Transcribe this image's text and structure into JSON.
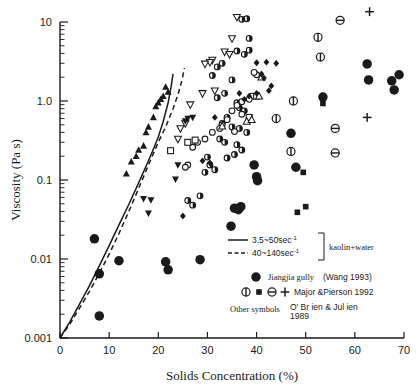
{
  "chart_data": {
    "type": "scatter",
    "title": "",
    "xlabel": "Solids Concentration (%)",
    "ylabel": "Viscosity  (Pa s)",
    "xlim": [
      0,
      70
    ],
    "ylim": [
      0.001,
      10
    ],
    "yscale": "log",
    "xscale": "linear",
    "grid": false,
    "xticks": [
      "0",
      "10",
      "20",
      "30",
      "40",
      "50",
      "60",
      "70"
    ],
    "xtick_values": [
      0,
      10,
      20,
      30,
      40,
      50,
      60,
      70
    ],
    "yticks": [
      "0.001",
      "0.01",
      "0.1",
      "1.0",
      "10"
    ],
    "ytick_values": [
      0.001,
      0.01,
      0.1,
      1.0,
      10
    ],
    "legend_position": "lower-right",
    "curves": [
      {
        "name": "3.5~50sec-1",
        "style": "solid",
        "label": "3.5~50sec",
        "exponent": "-1",
        "points": [
          [
            0,
            0.001
          ],
          [
            2,
            0.0016
          ],
          [
            4,
            0.0027
          ],
          [
            6,
            0.0046
          ],
          [
            8,
            0.0082
          ],
          [
            10,
            0.0148
          ],
          [
            12,
            0.027
          ],
          [
            14,
            0.049
          ],
          [
            16,
            0.092
          ],
          [
            18,
            0.175
          ],
          [
            19,
            0.245
          ],
          [
            20,
            0.35
          ],
          [
            21,
            0.55
          ],
          [
            22,
            0.95
          ],
          [
            22.6,
            1.5
          ],
          [
            23,
            2.2
          ]
        ]
      },
      {
        "name": "40~140sec-1",
        "style": "dashed",
        "label": "40~140sec",
        "exponent": "-1",
        "points": [
          [
            0,
            0.001
          ],
          [
            2,
            0.0015
          ],
          [
            4,
            0.0024
          ],
          [
            6,
            0.0039
          ],
          [
            8,
            0.0066
          ],
          [
            10,
            0.0115
          ],
          [
            12,
            0.021
          ],
          [
            14,
            0.04
          ],
          [
            16,
            0.078
          ],
          [
            18,
            0.155
          ],
          [
            20,
            0.3
          ],
          [
            21.5,
            0.47
          ],
          [
            23,
            0.8
          ],
          [
            24,
            1.2
          ],
          [
            24.8,
            1.8
          ],
          [
            25.3,
            2.6
          ]
        ]
      }
    ],
    "series": [
      {
        "name": "Jiangjia gully (Wang 1993)",
        "marker": "filled-circle",
        "points": [
          [
            7,
            0.018
          ],
          [
            8,
            0.0065
          ],
          [
            8,
            0.0019
          ],
          [
            12,
            0.0095
          ],
          [
            21.5,
            0.0092
          ],
          [
            22,
            0.0073
          ],
          [
            28.5,
            0.0098
          ],
          [
            34.8,
            0.026
          ],
          [
            35.5,
            0.044
          ],
          [
            36.3,
            0.042
          ],
          [
            36.8,
            0.046
          ],
          [
            39.5,
            0.155
          ],
          [
            40,
            0.11
          ],
          [
            40.2,
            0.098
          ],
          [
            47,
            0.39
          ],
          [
            48,
            0.145
          ],
          [
            53.5,
            1.12
          ],
          [
            62.5,
            2.95
          ],
          [
            62.8,
            1.85
          ],
          [
            67.5,
            1.8
          ],
          [
            68,
            1.38
          ],
          [
            69,
            2.15
          ]
        ]
      },
      {
        "name": "Major & Pierson 1992 circle-vertical-bar",
        "marker": "circle-vbar",
        "points": [
          [
            52.5,
            6.4
          ],
          [
            53,
            3.6
          ],
          [
            47.5,
            1.0
          ],
          [
            47,
            0.23
          ],
          [
            44,
            0.6
          ]
        ]
      },
      {
        "name": "Major & Pierson 1992 filled-square",
        "marker": "filled-square",
        "points": [
          [
            53.5,
            0.93
          ],
          [
            49.5,
            0.125
          ],
          [
            48.3,
            0.039
          ],
          [
            50,
            0.046
          ]
        ]
      },
      {
        "name": "Major & Pierson 1992 circle-hbar",
        "marker": "circle-hbar",
        "points": [
          [
            57,
            10.5
          ],
          [
            56,
            0.45
          ],
          [
            56,
            0.22
          ]
        ]
      },
      {
        "name": "Major & Pierson 1992 plus",
        "marker": "plus",
        "points": [
          [
            63,
            13.5
          ],
          [
            62.5,
            0.62
          ]
        ]
      },
      {
        "name": "O'Brien & Julien 1989 open-triangle-down",
        "marker": "open-triangle-down",
        "points": [
          [
            36,
            11.5
          ],
          [
            35,
            6.2
          ],
          [
            33.5,
            4.2
          ],
          [
            34.5,
            3.9
          ],
          [
            31,
            3.3
          ],
          [
            30.5,
            3.1
          ],
          [
            29.5,
            2.95
          ],
          [
            31.5,
            1.35
          ],
          [
            29,
            1.25
          ],
          [
            26.5,
            0.9
          ],
          [
            25.5,
            0.52
          ],
          [
            24.5,
            0.45
          ],
          [
            24,
            0.33
          ]
        ]
      },
      {
        "name": "O'Brien & Julien 1989 filled-triangle-up",
        "marker": "filled-triangle-up",
        "points": [
          [
            21.5,
            1.5
          ],
          [
            21,
            1.15
          ],
          [
            20.5,
            1.05
          ],
          [
            19.5,
            0.85
          ],
          [
            19,
            0.62
          ],
          [
            18,
            0.47
          ],
          [
            17.5,
            0.4
          ],
          [
            17,
            0.27
          ],
          [
            16,
            0.24
          ],
          [
            15.5,
            0.2
          ],
          [
            14.5,
            0.17
          ],
          [
            13.5,
            0.12
          ],
          [
            22,
            1.3
          ],
          [
            20,
            0.95
          ]
        ]
      },
      {
        "name": "O'Brien & Julien 1989 filled-triangle-down",
        "marker": "filled-triangle-down",
        "points": [
          [
            27,
            0.62
          ],
          [
            25.5,
            0.56
          ],
          [
            24,
            0.155
          ],
          [
            23.5,
            0.102
          ],
          [
            17,
            0.058
          ],
          [
            18.5,
            0.056
          ],
          [
            18,
            0.038
          ],
          [
            26,
            0.6
          ]
        ]
      },
      {
        "name": "O'Brien & Julien 1989 half-circle",
        "marker": "half-circle",
        "points": [
          [
            38,
            11.0
          ],
          [
            37,
            10.8
          ],
          [
            38.5,
            6.2
          ],
          [
            37.5,
            3.9
          ],
          [
            38.5,
            4.4
          ],
          [
            36,
            4.3
          ],
          [
            33,
            3.0
          ],
          [
            32,
            2.7
          ],
          [
            31,
            2.1
          ],
          [
            35,
            1.85
          ],
          [
            33.5,
            1.25
          ],
          [
            32,
            1.1
          ],
          [
            36,
            0.95
          ],
          [
            36.5,
            0.82
          ],
          [
            37.5,
            0.75
          ],
          [
            34,
            0.62
          ],
          [
            33,
            0.52
          ],
          [
            35,
            0.47
          ],
          [
            36.5,
            0.45
          ],
          [
            38,
            0.4
          ],
          [
            32.5,
            0.33
          ],
          [
            33.5,
            0.3
          ],
          [
            36,
            0.28
          ],
          [
            37,
            0.24
          ],
          [
            35.5,
            0.21
          ],
          [
            34,
            0.19
          ],
          [
            30.5,
            0.155
          ],
          [
            31.5,
            0.135
          ],
          [
            29.5,
            0.125
          ],
          [
            26,
            0.055
          ],
          [
            27,
            0.048
          ],
          [
            28.5,
            0.063
          ],
          [
            30,
            0.195
          ]
        ]
      },
      {
        "name": "O'Brien & Julien 1989 open-circle",
        "marker": "open-circle",
        "points": [
          [
            40,
            2.15
          ],
          [
            39,
            1.15
          ],
          [
            38.5,
            1.05
          ],
          [
            37,
            0.98
          ],
          [
            36,
            0.88
          ],
          [
            35,
            0.75
          ],
          [
            34,
            0.58
          ],
          [
            33,
            0.5
          ],
          [
            32.5,
            0.45
          ],
          [
            31,
            0.4
          ],
          [
            29.5,
            0.33
          ],
          [
            28,
            0.3
          ],
          [
            27,
            0.26
          ],
          [
            26,
            0.155
          ],
          [
            25.5,
            0.145
          ],
          [
            39.5,
            2.3
          ],
          [
            37,
            0.68
          ],
          [
            35.5,
            0.41
          ]
        ]
      },
      {
        "name": "O'Brien & Julien 1989 open-square",
        "marker": "open-square",
        "points": [
          [
            38.5,
            0.62
          ],
          [
            27.5,
            0.32
          ],
          [
            26,
            0.3
          ],
          [
            22.5,
            0.235
          ],
          [
            40,
            1.15
          ]
        ]
      },
      {
        "name": "O'Brien & Julien 1989 open-triangle-up",
        "marker": "open-triangle-up",
        "points": [
          [
            41,
            2.0
          ],
          [
            40.5,
            1.15
          ],
          [
            33,
            0.48
          ],
          [
            38,
            0.55
          ],
          [
            39,
            0.58
          ]
        ]
      },
      {
        "name": "O'Brien & Julien 1989 filled-diamond",
        "marker": "filled-diamond",
        "points": [
          [
            44,
            3.0
          ],
          [
            42,
            3.1
          ],
          [
            40,
            3.05
          ],
          [
            41.5,
            1.95
          ],
          [
            43,
            1.55
          ],
          [
            42.5,
            1.35
          ],
          [
            40,
            1.25
          ],
          [
            38.5,
            1.15
          ],
          [
            37.5,
            1.05
          ],
          [
            36.5,
            1.25
          ],
          [
            31.5,
            0.62
          ],
          [
            30.5,
            0.165
          ],
          [
            29,
            0.175
          ],
          [
            25,
            0.035
          ],
          [
            41,
            2.2
          ]
        ]
      }
    ]
  },
  "legend": {
    "curve_entries": [
      {
        "label": "3.5~50sec",
        "exponent": "-1",
        "style": "solid",
        "icon": "solid-line-icon"
      },
      {
        "label": "40~140sec",
        "exponent": "-1",
        "style": "dashed",
        "icon": "dashed-line-icon"
      }
    ],
    "bracket_label": "kaolin+water",
    "symbol_entries": [
      {
        "marker": "filled-circle",
        "label": "Jiangjia gully",
        "source": "(Wang 1993)"
      },
      {
        "markers": [
          "circle-vbar",
          "filled-square",
          "circle-hbar",
          "plus"
        ],
        "label": "Major &Pierson 1992"
      }
    ],
    "other_label": "Other symbols",
    "other_source_line1": "O' Br ien & Jul ien",
    "other_source_line2": "1989"
  },
  "colors": {
    "ink": "#1a1a1a",
    "background": "#ffffff",
    "marker": "#111111"
  }
}
